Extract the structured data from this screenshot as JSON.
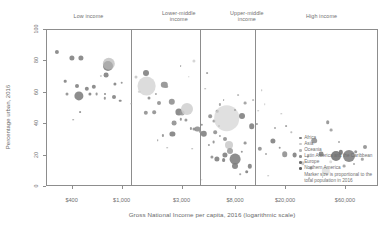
{
  "chart_data": {
    "type": "scatter",
    "title": "",
    "xlabel": "Gross National Income per capita, 2016 (logarithmic scale)",
    "ylabel": "Percentage urban, 2016",
    "x_scale": "log",
    "x_tick_labels": [
      "$400",
      "$1,000",
      "$3,000",
      "$8,000",
      "$20,000",
      "$60,000"
    ],
    "x_tick_values": [
      400,
      1000,
      3000,
      8000,
      20000,
      60000
    ],
    "y_tick_labels": [
      "0",
      "20",
      "40",
      "60",
      "80",
      "100"
    ],
    "y_tick_values": [
      0,
      20,
      40,
      60,
      80,
      100
    ],
    "ylim": [
      0,
      100
    ],
    "xlim": [
      250,
      110000
    ],
    "grid": false,
    "legend_position": "bottom-right-inside",
    "bands": [
      {
        "label": "Low income",
        "label_line2": "",
        "center_pct": 12.8
      },
      {
        "label": "Lower-middle",
        "label_line2": "income",
        "center_pct": 40.0
      },
      {
        "label": "Upper-middle",
        "label_line2": "income",
        "center_pct": 60.5
      },
      {
        "label": "High income",
        "label_line2": "",
        "center_pct": 83.0
      }
    ],
    "band_dividers_pct": [
      25.6,
      46.4,
      63.0
    ],
    "legend_entries": [
      {
        "label": "Africa",
        "color": "#7d7d7d"
      },
      {
        "label": "Asia",
        "color": "#c9c9c9"
      },
      {
        "label": "Oceania",
        "color": "#b5b5b5"
      },
      {
        "label": "Latin America and the Caribbean",
        "color": "#909090"
      },
      {
        "label": "Europe",
        "color": "#6e6e6e"
      },
      {
        "label": "Northern America",
        "color": "#5f5f5f"
      }
    ],
    "legend_note_line1": "Marker size is proportional to the",
    "legend_note_line2": "total population in 2016",
    "points": [
      {
        "x": 3.0,
        "y": 14.0,
        "r": 2.1,
        "c": "#7d7d7d"
      },
      {
        "x": 7.6,
        "y": 18.0,
        "r": 2.6,
        "c": "#7d7d7d"
      },
      {
        "x": 10.2,
        "y": 18.0,
        "r": 2.6,
        "c": "#7d7d7d"
      },
      {
        "x": 5.6,
        "y": 33.0,
        "r": 1.3,
        "c": "#7d7d7d"
      },
      {
        "x": 9.2,
        "y": 36.0,
        "r": 2.0,
        "c": "#7d7d7d"
      },
      {
        "x": 6.2,
        "y": 41.0,
        "r": 1.5,
        "c": "#8a8a8a"
      },
      {
        "x": 9.6,
        "y": 42.5,
        "r": 4.6,
        "c": "#7a7a7a"
      },
      {
        "x": 13.0,
        "y": 41.0,
        "r": 1.6,
        "c": "#7d7d7d"
      },
      {
        "x": 15.0,
        "y": 41.5,
        "r": 1.4,
        "c": "#8a8a8a"
      },
      {
        "x": 17.6,
        "y": 41.0,
        "r": 1.0,
        "c": "#7d7d7d"
      },
      {
        "x": 12.0,
        "y": 38.0,
        "r": 2.2,
        "c": "#7d7d7d"
      },
      {
        "x": 14.2,
        "y": 36.5,
        "r": 2.2,
        "c": "#7d7d7d"
      },
      {
        "x": 17.6,
        "y": 44.0,
        "r": 1.2,
        "c": "#8a8a8a"
      },
      {
        "x": 20.3,
        "y": 43.5,
        "r": 2.0,
        "c": "#7d7d7d"
      },
      {
        "x": 22.2,
        "y": 45.5,
        "r": 1.3,
        "c": "#7d7d7d"
      },
      {
        "x": 20.5,
        "y": 35.0,
        "r": 1.6,
        "c": "#7d7d7d"
      },
      {
        "x": 22.6,
        "y": 34.0,
        "r": 1.3,
        "c": "#8a8a8a"
      },
      {
        "x": 16.4,
        "y": 29.5,
        "r": 1.1,
        "c": "#c2c2c2"
      },
      {
        "x": 18.0,
        "y": 29.0,
        "r": 2.4,
        "c": "#7a7a7a"
      },
      {
        "x": 18.4,
        "y": 23.0,
        "r": 5.0,
        "c": "#7a7a7a"
      },
      {
        "x": 18.8,
        "y": 22.0,
        "r": 6.2,
        "c": "#b8b8b8"
      },
      {
        "x": 10.0,
        "y": 53.0,
        "r": 0.9,
        "c": "#8a8a8a"
      },
      {
        "x": 8.0,
        "y": 58.0,
        "r": 0.8,
        "c": "#8a8a8a"
      },
      {
        "x": 30.0,
        "y": 53.5,
        "r": 2.2,
        "c": "#8a8a8a"
      },
      {
        "x": 32.5,
        "y": 53.0,
        "r": 1.8,
        "c": "#8a8a8a"
      },
      {
        "x": 34.0,
        "y": 47.0,
        "r": 2.0,
        "c": "#8a8a8a"
      },
      {
        "x": 31.0,
        "y": 44.0,
        "r": 1.5,
        "c": "#8a8a8a"
      },
      {
        "x": 30.2,
        "y": 36.0,
        "r": 9.4,
        "c": "#cfcfcf"
      },
      {
        "x": 30.0,
        "y": 28.0,
        "r": 3.0,
        "c": "#7a7a7a"
      },
      {
        "x": 27.0,
        "y": 30.0,
        "r": 1.5,
        "c": "#c2c2c2"
      },
      {
        "x": 28.0,
        "y": 40.0,
        "r": 1.2,
        "c": "#cfcfcf"
      },
      {
        "x": 35.5,
        "y": 35.5,
        "r": 3.2,
        "c": "#8a8a8a"
      },
      {
        "x": 36.0,
        "y": 36.5,
        "r": 1.9,
        "c": "#9a9a9a"
      },
      {
        "x": 33.0,
        "y": 41.0,
        "r": 1.1,
        "c": "#9a9a9a"
      },
      {
        "x": 37.8,
        "y": 46.5,
        "r": 3.2,
        "c": "#8a8a8a"
      },
      {
        "x": 40.0,
        "y": 53.0,
        "r": 3.6,
        "c": "#7a7a7a"
      },
      {
        "x": 41.0,
        "y": 53.5,
        "r": 2.4,
        "c": "#9a9a9a"
      },
      {
        "x": 42.5,
        "y": 51.0,
        "r": 6.0,
        "c": "#cfcfcf"
      },
      {
        "x": 38.5,
        "y": 60.0,
        "r": 2.4,
        "c": "#8a8a8a"
      },
      {
        "x": 40.5,
        "y": 57.5,
        "r": 1.2,
        "c": "#8a8a8a"
      },
      {
        "x": 42.0,
        "y": 58.0,
        "r": 1.6,
        "c": "#8a8a8a"
      },
      {
        "x": 43.5,
        "y": 63.5,
        "r": 1.1,
        "c": "#8a8a8a"
      },
      {
        "x": 44.5,
        "y": 64.0,
        "r": 1.5,
        "c": "#8a8a8a"
      },
      {
        "x": 45.6,
        "y": 64.0,
        "r": 2.6,
        "c": "#8a8a8a"
      },
      {
        "x": 46.5,
        "y": 65.5,
        "r": 1.2,
        "c": "#9a9a9a"
      },
      {
        "x": 38.0,
        "y": 67.0,
        "r": 2.6,
        "c": "#7a7a7a"
      },
      {
        "x": 35.0,
        "y": 68.0,
        "r": 1.1,
        "c": "#8a8a8a"
      },
      {
        "x": 33.5,
        "y": 71.0,
        "r": 0.8,
        "c": "#8a8a8a"
      },
      {
        "x": 47.5,
        "y": 67.0,
        "r": 3.2,
        "c": "#7a7a7a"
      },
      {
        "x": 47.0,
        "y": 61.0,
        "r": 1.2,
        "c": "#8a8a8a"
      },
      {
        "x": 44.5,
        "y": 20.0,
        "r": 1.6,
        "c": "#cfcfcf"
      },
      {
        "x": 40.5,
        "y": 23.5,
        "r": 0.9,
        "c": "#9a9a9a"
      },
      {
        "x": 48.5,
        "y": 28.0,
        "r": 0.9,
        "c": "#9a9a9a"
      },
      {
        "x": 52.0,
        "y": 62.0,
        "r": 1.0,
        "c": "#9a9a9a"
      },
      {
        "x": 50.5,
        "y": 58.5,
        "r": 1.6,
        "c": "#9a9a9a"
      },
      {
        "x": 49.5,
        "y": 55.5,
        "r": 1.8,
        "c": "#8a8a8a"
      },
      {
        "x": 51.5,
        "y": 52.5,
        "r": 1.3,
        "c": "#8a8a8a"
      },
      {
        "x": 52.5,
        "y": 48.0,
        "r": 1.1,
        "c": "#9a9a9a"
      },
      {
        "x": 53.5,
        "y": 45.0,
        "r": 0.9,
        "c": "#9a9a9a"
      },
      {
        "x": 54.5,
        "y": 57.0,
        "r": 12.8,
        "c": "#d4d4d4"
      },
      {
        "x": 51.0,
        "y": 66.0,
        "r": 1.8,
        "c": "#8a8a8a"
      },
      {
        "x": 52.5,
        "y": 68.5,
        "r": 1.1,
        "c": "#9a9a9a"
      },
      {
        "x": 53.8,
        "y": 70.0,
        "r": 2.0,
        "c": "#8a8a8a"
      },
      {
        "x": 50.5,
        "y": 72.5,
        "r": 1.4,
        "c": "#8a8a8a"
      },
      {
        "x": 49.0,
        "y": 74.0,
        "r": 1.1,
        "c": "#8a8a8a"
      },
      {
        "x": 55.0,
        "y": 74.5,
        "r": 4.0,
        "c": "#cacaca"
      },
      {
        "x": 55.5,
        "y": 78.0,
        "r": 3.0,
        "c": "#9a9a9a"
      },
      {
        "x": 54.0,
        "y": 80.5,
        "r": 2.6,
        "c": "#7a7a7a"
      },
      {
        "x": 57.0,
        "y": 83.5,
        "r": 5.4,
        "c": "#7a7a7a"
      },
      {
        "x": 53.5,
        "y": 84.0,
        "r": 1.9,
        "c": "#7a7a7a"
      },
      {
        "x": 51.5,
        "y": 83.0,
        "r": 2.6,
        "c": "#7a7a7a"
      },
      {
        "x": 50.0,
        "y": 82.0,
        "r": 1.6,
        "c": "#8a8a8a"
      },
      {
        "x": 57.0,
        "y": 88.0,
        "r": 3.0,
        "c": "#7a7a7a"
      },
      {
        "x": 61.5,
        "y": 88.0,
        "r": 2.2,
        "c": "#7a7a7a"
      },
      {
        "x": 60.5,
        "y": 91.5,
        "r": 1.8,
        "c": "#7a7a7a"
      },
      {
        "x": 59.0,
        "y": 78.5,
        "r": 1.2,
        "c": "#8a8a8a"
      },
      {
        "x": 60.0,
        "y": 73.0,
        "r": 1.4,
        "c": "#8a8a8a"
      },
      {
        "x": 62.0,
        "y": 62.0,
        "r": 2.8,
        "c": "#7a7a7a"
      },
      {
        "x": 63.5,
        "y": 60.5,
        "r": 1.1,
        "c": "#8a8a8a"
      },
      {
        "x": 59.0,
        "y": 55.5,
        "r": 3.0,
        "c": "#7a7a7a"
      },
      {
        "x": 57.0,
        "y": 51.5,
        "r": 1.0,
        "c": "#9a9a9a"
      },
      {
        "x": 60.0,
        "y": 47.0,
        "r": 1.4,
        "c": "#9a9a9a"
      },
      {
        "x": 62.5,
        "y": 45.0,
        "r": 0.9,
        "c": "#b5b5b5"
      },
      {
        "x": 58.0,
        "y": 42.0,
        "r": 0.9,
        "c": "#b5b5b5"
      },
      {
        "x": 65.0,
        "y": 39.0,
        "r": 0.8,
        "c": "#b5b5b5"
      },
      {
        "x": 64.5,
        "y": 76.5,
        "r": 2.2,
        "c": "#8a8a8a"
      },
      {
        "x": 66.5,
        "y": 80.0,
        "r": 1.0,
        "c": "#9a9a9a"
      },
      {
        "x": 68.5,
        "y": 71.5,
        "r": 2.6,
        "c": "#7a7a7a"
      },
      {
        "x": 70.5,
        "y": 76.0,
        "r": 1.3,
        "c": "#8a8a8a"
      },
      {
        "x": 72.0,
        "y": 80.0,
        "r": 2.8,
        "c": "#8a8a8a"
      },
      {
        "x": 69.0,
        "y": 63.0,
        "r": 1.0,
        "c": "#9a9a9a"
      },
      {
        "x": 72.5,
        "y": 62.0,
        "r": 0.9,
        "c": "#9a9a9a"
      },
      {
        "x": 75.0,
        "y": 80.5,
        "r": 2.4,
        "c": "#7a7a7a"
      },
      {
        "x": 77.5,
        "y": 86.0,
        "r": 1.7,
        "c": "#c5c5c5"
      },
      {
        "x": 79.0,
        "y": 82.0,
        "r": 1.2,
        "c": "#9a9a9a"
      },
      {
        "x": 80.0,
        "y": 89.0,
        "r": 1.6,
        "c": "#8a8a8a"
      },
      {
        "x": 81.0,
        "y": 71.5,
        "r": 2.8,
        "c": "#8a8a8a"
      },
      {
        "x": 83.0,
        "y": 80.0,
        "r": 2.4,
        "c": "#7a7a7a"
      },
      {
        "x": 84.5,
        "y": 91.0,
        "r": 4.2,
        "c": "#e0e0e0"
      },
      {
        "x": 86.0,
        "y": 85.0,
        "r": 1.8,
        "c": "#d8d8d8"
      },
      {
        "x": 87.5,
        "y": 81.0,
        "r": 5.0,
        "c": "#6e6e6e"
      },
      {
        "x": 89.0,
        "y": 79.0,
        "r": 2.2,
        "c": "#6e6e6e"
      },
      {
        "x": 91.5,
        "y": 81.0,
        "r": 6.0,
        "c": "#7a7a7a"
      },
      {
        "x": 93.5,
        "y": 78.5,
        "r": 1.8,
        "c": "#8a8a8a"
      },
      {
        "x": 90.0,
        "y": 88.0,
        "r": 1.4,
        "c": "#9a9a9a"
      },
      {
        "x": 93.0,
        "y": 86.5,
        "r": 1.0,
        "c": "#9a9a9a"
      },
      {
        "x": 95.5,
        "y": 83.5,
        "r": 1.2,
        "c": "#9a9a9a"
      },
      {
        "x": 96.5,
        "y": 75.5,
        "r": 2.0,
        "c": "#8a8a8a"
      },
      {
        "x": 88.5,
        "y": 72.0,
        "r": 1.0,
        "c": "#9a9a9a"
      },
      {
        "x": 86.0,
        "y": 64.5,
        "r": 1.4,
        "c": "#9a9a9a"
      },
      {
        "x": 85.0,
        "y": 59.5,
        "r": 1.8,
        "c": "#8a8a8a"
      },
      {
        "x": 83.5,
        "y": 95.0,
        "r": 0.9,
        "c": "#c5c5c5"
      },
      {
        "x": 79.5,
        "y": 95.5,
        "r": 0.8,
        "c": "#b5b5b5"
      },
      {
        "x": 67.0,
        "y": 94.0,
        "r": 0.8,
        "c": "#b5b5b5"
      },
      {
        "x": 64.0,
        "y": 52.0,
        "r": 0.8,
        "c": "#b5b5b5"
      },
      {
        "x": 66.0,
        "y": 48.0,
        "r": 0.8,
        "c": "#c5c5c5"
      },
      {
        "x": 44.0,
        "y": 76.5,
        "r": 0.8,
        "c": "#a5a5a5"
      },
      {
        "x": 36.5,
        "y": 76.0,
        "r": 0.8,
        "c": "#a5a5a5"
      },
      {
        "x": 25.5,
        "y": 47.5,
        "r": 0.8,
        "c": "#a5a5a5"
      },
      {
        "x": 48.0,
        "y": 38.0,
        "r": 0.8,
        "c": "#a5a5a5"
      },
      {
        "x": 43.0,
        "y": 30.0,
        "r": 0.7,
        "c": "#a5a5a5"
      },
      {
        "x": 71.0,
        "y": 54.0,
        "r": 0.7,
        "c": "#b5b5b5"
      },
      {
        "x": 74.0,
        "y": 66.0,
        "r": 0.7,
        "c": "#b5b5b5"
      },
      {
        "x": 58.5,
        "y": 93.0,
        "r": 0.8,
        "c": "#9a9a9a"
      },
      {
        "x": 47.0,
        "y": 96.5,
        "r": 0.7,
        "c": "#b5b5b5"
      }
    ]
  }
}
